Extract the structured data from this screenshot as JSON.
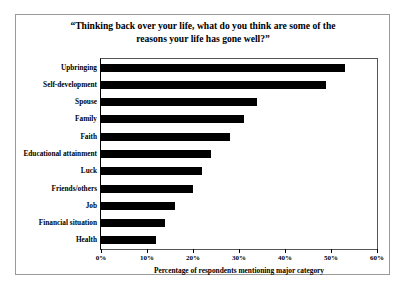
{
  "chart_data": {
    "type": "bar",
    "orientation": "horizontal",
    "title": "“Thinking back over your life, what do you think are some of the reasons your life has gone well?”",
    "title_line1": "“Thinking back over your life, what do you think are some of the",
    "title_line2": "reasons your life has gone well?”",
    "xlabel": "Percentage of respondents mentioning major category",
    "ylabel": "",
    "categories": [
      "Upbringing",
      "Self-development",
      "Spouse",
      "Family",
      "Faith",
      "Educational attainment",
      "Luck",
      "Friends/others",
      "Job",
      "Financial situation",
      "Health"
    ],
    "values": [
      53,
      49,
      34,
      31,
      28,
      24,
      22,
      20,
      16,
      14,
      12
    ],
    "value_labels": [
      "53%",
      "49%",
      "34%",
      "31%",
      "28%",
      "24%",
      "22%",
      "20%",
      "16%",
      "14%",
      "12%"
    ],
    "xlim": [
      0,
      60
    ],
    "xticks": [
      0,
      10,
      20,
      30,
      40,
      50,
      60
    ],
    "xtick_labels": [
      "0%",
      "10%",
      "20%",
      "30%",
      "40%",
      "50%",
      "60%"
    ],
    "grid": false,
    "legend": null,
    "bar_color": "#000000",
    "background_color": "#ffffff",
    "frame_color": "#555555"
  }
}
